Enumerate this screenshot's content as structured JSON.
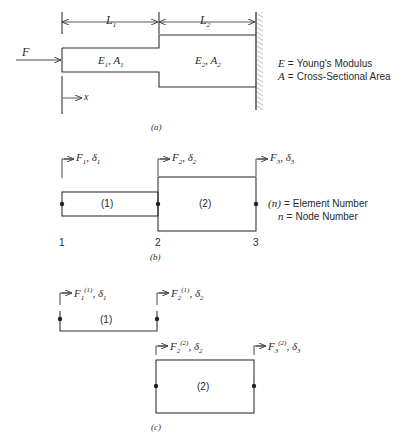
{
  "figure_a": {
    "caption": "(a)",
    "dimension_L1": {
      "symbol": "L",
      "sub": "1"
    },
    "dimension_L2": {
      "symbol": "L",
      "sub": "2"
    },
    "force_label": "F",
    "x_axis_label": "x",
    "segment1": {
      "E": "E",
      "E_sub": "1",
      "A": "A",
      "A_sub": "1"
    },
    "segment2": {
      "E": "E",
      "E_sub": "2",
      "A": "A",
      "A_sub": "2"
    },
    "legend": [
      {
        "symbol": "E",
        "eq": "=",
        "text": "Young's Modulus"
      },
      {
        "symbol": "A",
        "eq": "=",
        "text": "Cross-Sectional Area"
      }
    ]
  },
  "figure_b": {
    "caption": "(b)",
    "elements": [
      {
        "label": "(1)"
      },
      {
        "label": "(2)"
      }
    ],
    "nodes": [
      "1",
      "2",
      "3"
    ],
    "forces": [
      {
        "F": "F",
        "F_sub": "1",
        "d": "δ",
        "d_sub": "1"
      },
      {
        "F": "F",
        "F_sub": "2",
        "d": "δ",
        "d_sub": "2"
      },
      {
        "F": "F",
        "F_sub": "3",
        "d": "δ",
        "d_sub": "3"
      }
    ],
    "legend": [
      {
        "symbol": "(n)",
        "eq": "=",
        "text": "Element Number"
      },
      {
        "symbol": "n",
        "eq": "=",
        "text": "Node Number"
      }
    ]
  },
  "figure_c": {
    "caption": "(c)",
    "elements": [
      {
        "label": "(1)"
      },
      {
        "label": "(2)"
      }
    ],
    "forces": [
      {
        "F": "F",
        "F_sub": "1",
        "F_sup": "(1)",
        "d": "δ",
        "d_sub": "1"
      },
      {
        "F": "F",
        "F_sub": "2",
        "F_sup": "(1)",
        "d": "δ",
        "d_sub": "2"
      },
      {
        "F": "F",
        "F_sub": "2",
        "F_sup": "(2)",
        "d": "δ",
        "d_sub": "2"
      },
      {
        "F": "F",
        "F_sub": "3",
        "F_sup": "(2)",
        "d": "δ",
        "d_sub": "3"
      }
    ]
  }
}
